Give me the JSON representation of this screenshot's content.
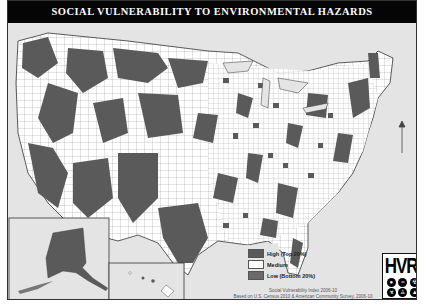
{
  "title": "SOCIAL VULNERABILITY TO ENVIRONMENTAL HAZARDS",
  "legend": {
    "items": [
      {
        "label": "High (Top 20%)",
        "color": "#5a5a5a"
      },
      {
        "label": "Medium",
        "color": "#ffffff"
      },
      {
        "label": "Low (Bottom 20%)",
        "color": "#6a6a6a"
      }
    ]
  },
  "footnote": {
    "line1": "Social Vulnerability Index 2006-10",
    "line2": "Based on U.S. Census 2010 & American Community Survey, 2006-10"
  },
  "logo": {
    "text": "HVRI",
    "icons": [
      "hazard-icon-1",
      "hazard-icon-2",
      "radiation-icon",
      "biohazard-icon",
      "person-icon",
      "fire-icon"
    ]
  },
  "insets": [
    "Alaska",
    "Hawaii"
  ],
  "colors": {
    "background": "#e4e4e4",
    "title_bar": "#050505",
    "high": "#5a5a5a",
    "medium": "#ffffff",
    "water": "#e4e4e4"
  }
}
